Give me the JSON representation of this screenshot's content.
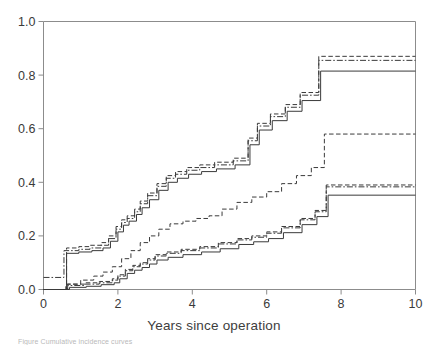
{
  "figure": {
    "xaxis_title": "Years since operation",
    "caption": "Figure  Cumulative incidence curves"
  },
  "chart_data": {
    "type": "line",
    "title": "",
    "xlabel": "Years since operation",
    "ylabel": "",
    "xlim": [
      0,
      10
    ],
    "ylim": [
      0,
      1.0
    ],
    "xticks": [
      0,
      2,
      4,
      6,
      8,
      10
    ],
    "xtick_labels": [
      "0",
      "2",
      "4",
      "6",
      "8",
      "10"
    ],
    "yticks": [
      0.0,
      0.2,
      0.4,
      0.6,
      0.8,
      1.0
    ],
    "ytick_labels": [
      "0.0",
      "0.2",
      "0.4",
      "0.6",
      "0.8",
      "1.0"
    ],
    "grid": false,
    "legend": "none",
    "step_type": "post",
    "line_color": "#3a3a3a",
    "series": [
      {
        "name": "upper-dashed",
        "style": "dashed",
        "x": [
          0,
          0.62,
          0.62,
          0.95,
          1.25,
          1.55,
          1.75,
          1.95,
          2.1,
          2.25,
          2.45,
          2.6,
          2.8,
          3.05,
          3.3,
          3.55,
          3.85,
          4.2,
          4.6,
          5.1,
          5.5,
          5.75,
          6.1,
          6.5,
          6.9,
          7.4,
          10
        ],
        "y": [
          0.0,
          0.0,
          0.155,
          0.16,
          0.165,
          0.175,
          0.2,
          0.235,
          0.26,
          0.275,
          0.3,
          0.33,
          0.36,
          0.395,
          0.425,
          0.44,
          0.455,
          0.465,
          0.475,
          0.49,
          0.565,
          0.62,
          0.655,
          0.69,
          0.735,
          0.87,
          0.87
        ]
      },
      {
        "name": "upper-dashdot",
        "style": "dashdot",
        "x": [
          0,
          0.55,
          0.55,
          0.95,
          1.25,
          1.55,
          1.75,
          1.95,
          2.1,
          2.25,
          2.45,
          2.6,
          2.8,
          3.05,
          3.3,
          3.55,
          3.85,
          4.2,
          4.6,
          5.1,
          5.5,
          5.75,
          6.1,
          6.5,
          6.9,
          7.4,
          10
        ],
        "y": [
          0.045,
          0.045,
          0.145,
          0.15,
          0.155,
          0.165,
          0.19,
          0.225,
          0.25,
          0.265,
          0.29,
          0.32,
          0.35,
          0.385,
          0.415,
          0.43,
          0.445,
          0.455,
          0.465,
          0.48,
          0.555,
          0.61,
          0.645,
          0.68,
          0.725,
          0.855,
          0.855
        ]
      },
      {
        "name": "upper-solid",
        "style": "solid",
        "x": [
          0,
          0.62,
          0.62,
          0.95,
          1.3,
          1.6,
          1.8,
          2.0,
          2.15,
          2.3,
          2.5,
          2.65,
          2.85,
          3.1,
          3.35,
          3.6,
          3.9,
          4.25,
          4.65,
          5.15,
          5.55,
          5.8,
          6.15,
          6.55,
          6.95,
          7.45,
          10
        ],
        "y": [
          0.0,
          0.0,
          0.135,
          0.14,
          0.145,
          0.155,
          0.18,
          0.215,
          0.24,
          0.255,
          0.28,
          0.305,
          0.335,
          0.37,
          0.4,
          0.415,
          0.43,
          0.44,
          0.45,
          0.465,
          0.54,
          0.595,
          0.63,
          0.665,
          0.705,
          0.815,
          0.815
        ]
      },
      {
        "name": "middle-dashed",
        "style": "dashed",
        "x": [
          0,
          0.6,
          0.6,
          1.0,
          1.35,
          1.6,
          1.85,
          2.1,
          2.35,
          2.6,
          2.85,
          3.1,
          3.4,
          3.75,
          4.1,
          4.45,
          4.8,
          5.2,
          5.6,
          6.0,
          6.4,
          6.8,
          7.2,
          7.55,
          10
        ],
        "y": [
          0.0,
          0.0,
          0.02,
          0.035,
          0.05,
          0.065,
          0.085,
          0.115,
          0.145,
          0.175,
          0.2,
          0.225,
          0.245,
          0.255,
          0.265,
          0.275,
          0.3,
          0.325,
          0.345,
          0.365,
          0.395,
          0.425,
          0.455,
          0.58,
          0.58
        ]
      },
      {
        "name": "lower-dashed",
        "style": "dashed",
        "x": [
          0,
          0.65,
          0.65,
          1.1,
          1.5,
          1.85,
          2.0,
          2.2,
          2.4,
          2.6,
          2.8,
          3.0,
          3.3,
          3.7,
          4.2,
          4.7,
          5.2,
          5.6,
          6.0,
          6.4,
          6.9,
          7.3,
          7.6,
          10
        ],
        "y": [
          0.0,
          0.0,
          0.02,
          0.025,
          0.03,
          0.04,
          0.055,
          0.075,
          0.09,
          0.1,
          0.115,
          0.13,
          0.14,
          0.15,
          0.16,
          0.175,
          0.19,
          0.2,
          0.215,
          0.235,
          0.265,
          0.295,
          0.39,
          0.39
        ]
      },
      {
        "name": "lower-dashdot",
        "style": "dashdot",
        "x": [
          0,
          0.65,
          0.65,
          1.1,
          1.5,
          1.85,
          2.0,
          2.2,
          2.4,
          2.6,
          2.8,
          3.0,
          3.3,
          3.7,
          4.2,
          4.7,
          5.2,
          5.6,
          6.0,
          6.4,
          6.9,
          7.3,
          7.6,
          10
        ],
        "y": [
          0.0,
          0.0,
          0.015,
          0.02,
          0.025,
          0.035,
          0.05,
          0.07,
          0.085,
          0.095,
          0.11,
          0.125,
          0.135,
          0.145,
          0.155,
          0.17,
          0.185,
          0.195,
          0.21,
          0.23,
          0.26,
          0.29,
          0.383,
          0.383
        ]
      },
      {
        "name": "lower-solid",
        "style": "solid",
        "x": [
          0,
          0.7,
          0.7,
          1.15,
          1.55,
          1.9,
          2.05,
          2.25,
          2.45,
          2.65,
          2.85,
          3.05,
          3.35,
          3.75,
          4.25,
          4.75,
          5.25,
          5.65,
          6.05,
          6.45,
          6.95,
          7.35,
          7.65,
          10
        ],
        "y": [
          0.0,
          0.0,
          0.008,
          0.012,
          0.018,
          0.025,
          0.04,
          0.06,
          0.072,
          0.082,
          0.095,
          0.11,
          0.12,
          0.13,
          0.14,
          0.152,
          0.168,
          0.178,
          0.19,
          0.212,
          0.242,
          0.272,
          0.352,
          0.352
        ]
      }
    ]
  }
}
